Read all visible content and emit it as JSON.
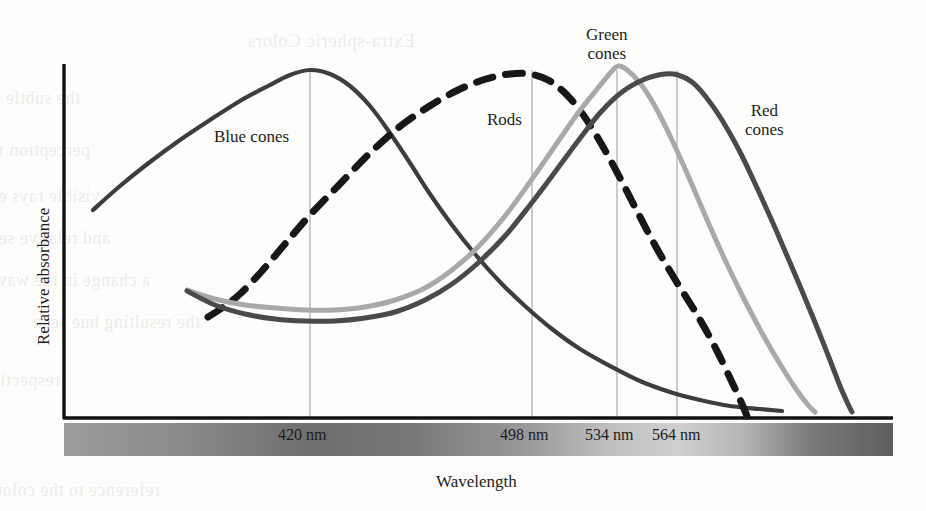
{
  "figure": {
    "background_color": "#fdfdfc",
    "ink_color": "#1d1d1d"
  },
  "axes": {
    "y_axis_label": "Relative absorbance",
    "x_axis_label": "Wavelength",
    "axis_color": "#111111",
    "origin_px": {
      "x": 64,
      "y": 418
    },
    "x_end_px": 893,
    "y_top_px": 64
  },
  "spectrum_bar": {
    "name": "visible-spectrum-gradient",
    "left_px": 64,
    "right_px": 893,
    "top_px": 423,
    "height_px": 33,
    "stops": [
      {
        "pos": 0,
        "color": "#9d9d9d"
      },
      {
        "pos": 14,
        "color": "#8a8a8a"
      },
      {
        "pos": 30,
        "color": "#6e6e6e"
      },
      {
        "pos": 42,
        "color": "#787878"
      },
      {
        "pos": 56,
        "color": "#9a9a9a"
      },
      {
        "pos": 66,
        "color": "#c0c0c0"
      },
      {
        "pos": 74,
        "color": "#cfcfcf"
      },
      {
        "pos": 82,
        "color": "#b5b5b5"
      },
      {
        "pos": 90,
        "color": "#7a7a7a"
      },
      {
        "pos": 100,
        "color": "#5e5e5e"
      }
    ]
  },
  "ticks": [
    {
      "label": "420 nm",
      "x_px": 310,
      "label_x_px": 278,
      "label_y_px": 426
    },
    {
      "label": "498 nm",
      "x_px": 532,
      "label_x_px": 500,
      "label_y_px": 426
    },
    {
      "label": "534 nm",
      "x_px": 617,
      "label_x_px": 585,
      "label_y_px": 426
    },
    {
      "label": "564 nm",
      "x_px": 677,
      "label_x_px": 652,
      "label_y_px": 426
    }
  ],
  "curve_labels": {
    "blue_cones": {
      "text": "Blue cones",
      "x_px": 214,
      "y_px": 127
    },
    "rods": {
      "text": "Rods",
      "x_px": 487,
      "y_px": 110
    },
    "green_cones": {
      "line1": "Green",
      "line2": "cones",
      "x_px": 586,
      "y_px": 25
    },
    "red_cones": {
      "line1": "Red",
      "line2": "cones",
      "x_px": 745,
      "y_px": 101
    }
  },
  "chart_data": {
    "type": "line",
    "title": "",
    "subtitle": "",
    "xlabel": "Wavelength",
    "ylabel": "Relative absorbance",
    "xlim": [
      380,
      700
    ],
    "ylim": [
      0,
      1
    ],
    "grid": false,
    "gridlines_vertical_at": [
      420,
      498,
      534,
      564
    ],
    "legend": "inline-curve-labels",
    "tick_labels": [
      "420 nm",
      "498 nm",
      "534 nm",
      "564 nm"
    ],
    "series": [
      {
        "name": "Blue cones",
        "peak_nm": 420,
        "color": "#3d3d3d",
        "style": "solid",
        "width": 4.2,
        "points_px": [
          [
            93,
            210
          ],
          [
            120,
            186
          ],
          [
            150,
            162
          ],
          [
            180,
            140
          ],
          [
            210,
            120
          ],
          [
            240,
            101
          ],
          [
            268,
            86
          ],
          [
            290,
            75
          ],
          [
            310,
            70
          ],
          [
            330,
            74
          ],
          [
            350,
            86
          ],
          [
            370,
            106
          ],
          [
            390,
            133
          ],
          [
            410,
            163
          ],
          [
            430,
            194
          ],
          [
            452,
            225
          ],
          [
            475,
            254
          ],
          [
            500,
            282
          ],
          [
            525,
            306
          ],
          [
            552,
            329
          ],
          [
            580,
            349
          ],
          [
            610,
            366
          ],
          [
            640,
            381
          ],
          [
            670,
            392
          ],
          [
            700,
            400
          ],
          [
            730,
            406
          ],
          [
            760,
            409
          ],
          [
            782,
            411
          ]
        ]
      },
      {
        "name": "Rods",
        "peak_nm": 498,
        "color": "#171717",
        "style": "dashed",
        "dash": "17 13",
        "width": 7,
        "points_px": [
          [
            208,
            317
          ],
          [
            222,
            308
          ],
          [
            240,
            294
          ],
          [
            262,
            271
          ],
          [
            285,
            244
          ],
          [
            310,
            215
          ],
          [
            338,
            186
          ],
          [
            368,
            155
          ],
          [
            398,
            128
          ],
          [
            428,
            107
          ],
          [
            458,
            90
          ],
          [
            486,
            79
          ],
          [
            510,
            74
          ],
          [
            530,
            74
          ],
          [
            548,
            80
          ],
          [
            566,
            94
          ],
          [
            584,
            116
          ],
          [
            602,
            145
          ],
          [
            620,
            178
          ],
          [
            638,
            213
          ],
          [
            656,
            247
          ],
          [
            676,
            281
          ],
          [
            696,
            313
          ],
          [
            714,
            345
          ],
          [
            730,
            378
          ],
          [
            742,
            404
          ],
          [
            747,
            416
          ]
        ]
      },
      {
        "name": "Green cones",
        "peak_nm": 534,
        "color": "#a9a9a9",
        "style": "solid",
        "width": 5,
        "points_px": [
          [
            187,
            290
          ],
          [
            215,
            299
          ],
          [
            245,
            305
          ],
          [
            275,
            308
          ],
          [
            305,
            310
          ],
          [
            335,
            310
          ],
          [
            365,
            307
          ],
          [
            395,
            300
          ],
          [
            425,
            288
          ],
          [
            452,
            270
          ],
          [
            478,
            247
          ],
          [
            505,
            216
          ],
          [
            530,
            182
          ],
          [
            555,
            146
          ],
          [
            578,
            113
          ],
          [
            598,
            88
          ],
          [
            612,
            71
          ],
          [
            618,
            66
          ],
          [
            626,
            69
          ],
          [
            640,
            83
          ],
          [
            656,
            108
          ],
          [
            672,
            140
          ],
          [
            690,
            180
          ],
          [
            708,
            222
          ],
          [
            726,
            262
          ],
          [
            744,
            299
          ],
          [
            762,
            333
          ],
          [
            780,
            364
          ],
          [
            796,
            389
          ],
          [
            808,
            405
          ],
          [
            815,
            412
          ]
        ]
      },
      {
        "name": "Red cones",
        "peak_nm": 564,
        "color": "#4a4a4a",
        "style": "solid",
        "width": 5,
        "points_px": [
          [
            187,
            291
          ],
          [
            215,
            305
          ],
          [
            245,
            314
          ],
          [
            275,
            319
          ],
          [
            305,
            321
          ],
          [
            335,
            321
          ],
          [
            365,
            318
          ],
          [
            395,
            312
          ],
          [
            425,
            300
          ],
          [
            452,
            284
          ],
          [
            478,
            263
          ],
          [
            505,
            236
          ],
          [
            530,
            205
          ],
          [
            555,
            172
          ],
          [
            578,
            141
          ],
          [
            600,
            113
          ],
          [
            622,
            92
          ],
          [
            645,
            79
          ],
          [
            665,
            74
          ],
          [
            678,
            75
          ],
          [
            692,
            82
          ],
          [
            706,
            97
          ],
          [
            722,
            120
          ],
          [
            740,
            152
          ],
          [
            758,
            190
          ],
          [
            776,
            230
          ],
          [
            794,
            272
          ],
          [
            812,
            315
          ],
          [
            828,
            355
          ],
          [
            840,
            386
          ],
          [
            848,
            404
          ],
          [
            852,
            412
          ]
        ]
      }
    ]
  },
  "ghost_text": [
    {
      "text": "Extra-spheric Colors",
      "x": 415,
      "y": 30,
      "size": 19
    },
    {
      "text": "the subtle shade of light spectra correspond",
      "x": 80,
      "y": 88,
      "size": 18
    },
    {
      "text": "perception when overlapping the absorbance",
      "x": 90,
      "y": 140,
      "size": 18
    },
    {
      "text": "visible rays enter the retina of the eye",
      "x": 100,
      "y": 186,
      "size": 18
    },
    {
      "text": "and relative sensitivity of cones when",
      "x": 110,
      "y": 228,
      "size": 18
    },
    {
      "text": "a change in the wavelength shifts",
      "x": 150,
      "y": 270,
      "size": 18
    },
    {
      "text": "the resulting hue seen",
      "x": 200,
      "y": 312,
      "size": 18
    },
    {
      "text": "respectively on all the cells present in the human eye",
      "x": 60,
      "y": 370,
      "size": 18
    },
    {
      "text": "reference to the colour as given",
      "x": 160,
      "y": 480,
      "size": 18
    }
  ]
}
